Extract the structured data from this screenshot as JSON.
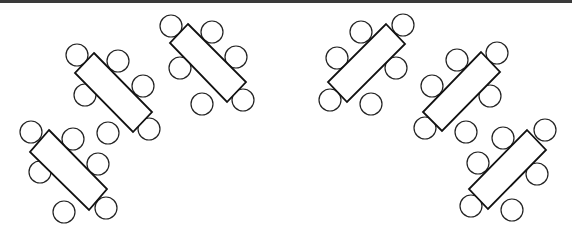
{
  "diagram": {
    "title": "",
    "colors": {
      "stroke": "#111111",
      "fill": "#ffffff",
      "topbar": "#3a3a3a"
    },
    "chair_radius": 11,
    "tables": [
      {
        "id": "table-1",
        "corners": [
          [
            49,
            130
          ],
          [
            107,
            189
          ],
          [
            89,
            210
          ],
          [
            30,
            152
          ]
        ],
        "chairs": [
          [
            31,
            132
          ],
          [
            73,
            139
          ],
          [
            98,
            164
          ],
          [
            106,
            208
          ],
          [
            64,
            212
          ],
          [
            40,
            172
          ]
        ]
      },
      {
        "id": "table-2",
        "corners": [
          [
            94,
            53
          ],
          [
            152,
            112
          ],
          [
            133,
            132
          ],
          [
            75,
            73
          ]
        ],
        "chairs": [
          [
            77,
            55
          ],
          [
            118,
            61
          ],
          [
            143,
            86
          ],
          [
            149,
            129
          ],
          [
            108,
            133
          ],
          [
            85,
            95
          ]
        ]
      },
      {
        "id": "table-3",
        "corners": [
          [
            188,
            24
          ],
          [
            246,
            82
          ],
          [
            227,
            102
          ],
          [
            170,
            43
          ]
        ],
        "chairs": [
          [
            171,
            26
          ],
          [
            212,
            32
          ],
          [
            236,
            57
          ],
          [
            243,
            100
          ],
          [
            202,
            104
          ],
          [
            180,
            68
          ]
        ]
      },
      {
        "id": "table-4",
        "corners": [
          [
            386,
            24
          ],
          [
            405,
            44
          ],
          [
            347,
            102
          ],
          [
            328,
            82
          ]
        ],
        "chairs": [
          [
            403,
            25
          ],
          [
            361,
            32
          ],
          [
            337,
            58
          ],
          [
            330,
            100
          ],
          [
            371,
            104
          ],
          [
            396,
            68
          ]
        ]
      },
      {
        "id": "table-5",
        "corners": [
          [
            481,
            52
          ],
          [
            500,
            72
          ],
          [
            442,
            131
          ],
          [
            423,
            112
          ]
        ],
        "chairs": [
          [
            497,
            53
          ],
          [
            457,
            60
          ],
          [
            432,
            86
          ],
          [
            425,
            128
          ],
          [
            466,
            132
          ],
          [
            490,
            96
          ]
        ]
      },
      {
        "id": "table-6",
        "corners": [
          [
            527,
            130
          ],
          [
            546,
            150
          ],
          [
            488,
            209
          ],
          [
            469,
            189
          ]
        ],
        "chairs": [
          [
            545,
            130
          ],
          [
            503,
            138
          ],
          [
            478,
            163
          ],
          [
            471,
            206
          ],
          [
            512,
            210
          ],
          [
            537,
            174
          ]
        ]
      }
    ]
  }
}
